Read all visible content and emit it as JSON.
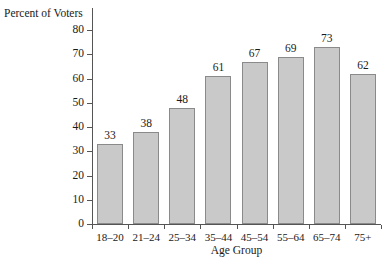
{
  "chart_data": {
    "type": "bar",
    "title": "",
    "xlabel": "Age Group",
    "ylabel": "Percent of Voters",
    "categories": [
      "18–20",
      "21–24",
      "25–34",
      "35–44",
      "45–54",
      "55–64",
      "65–74",
      "75+"
    ],
    "values": [
      33,
      38,
      48,
      61,
      67,
      69,
      73,
      62
    ],
    "data_labels": [
      "33",
      "38",
      "48",
      "61",
      "67",
      "69",
      "73",
      "62"
    ],
    "ylim": [
      0,
      80
    ],
    "ytick_labels": [
      "0",
      "10",
      "20",
      "30",
      "40",
      "50",
      "60",
      "70",
      "80"
    ],
    "ytick_values": [
      0,
      10,
      20,
      30,
      40,
      50,
      60,
      70,
      80
    ],
    "grid": false,
    "legend": false,
    "bar_fill_color": "#c9c9c9",
    "bar_border_color": "#8a8a8a",
    "axis_color": "#555555",
    "background_color": "#ffffff"
  }
}
